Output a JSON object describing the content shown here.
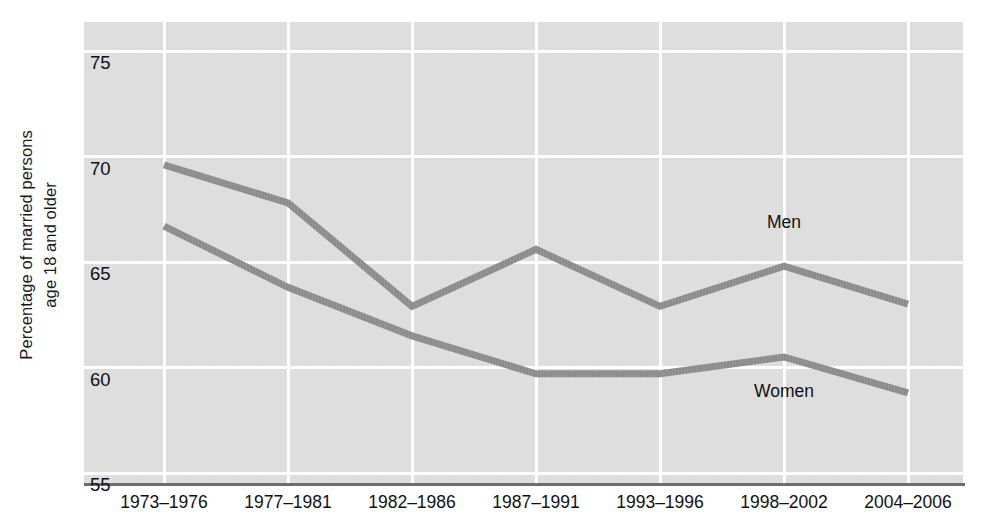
{
  "chart_data": {
    "type": "line",
    "title": "",
    "xlabel": "",
    "ylabel": "Percentage of married persons age 18 and older",
    "ylabel_line1": "Percentage of married persons",
    "ylabel_line2": "age 18 and older",
    "categories": [
      "1973–1976",
      "1977–1981",
      "1982–1986",
      "1987–1991",
      "1993–1996",
      "1998–2002",
      "2004–2006"
    ],
    "yticks": [
      75,
      70,
      65,
      60,
      55
    ],
    "ytick_labels": [
      "75",
      "70",
      "65",
      "60",
      "55"
    ],
    "ylim": [
      55,
      75
    ],
    "grid": true,
    "legend_position": "inline-labels",
    "series": [
      {
        "name": "Men",
        "label": "Men",
        "color": "#8c8c8c",
        "values": [
          69.6,
          67.8,
          62.9,
          65.6,
          62.9,
          64.8,
          63.0
        ],
        "label_x_category": "1998–2002",
        "label_y": 66.9
      },
      {
        "name": "Women",
        "label": "Women",
        "color": "#8c8c8c",
        "values": [
          66.7,
          63.8,
          61.5,
          59.7,
          59.7,
          60.5,
          58.8
        ],
        "label_x_category": "1998–2002",
        "label_y": 58.9
      }
    ]
  },
  "style": {
    "plot_background": "#dddddd",
    "gridline_color": "#ffffff",
    "axis_color": "#6e6e6e",
    "line_color": "#8c8c8c",
    "text_color": "#111111",
    "page_background": "#ffffff"
  }
}
